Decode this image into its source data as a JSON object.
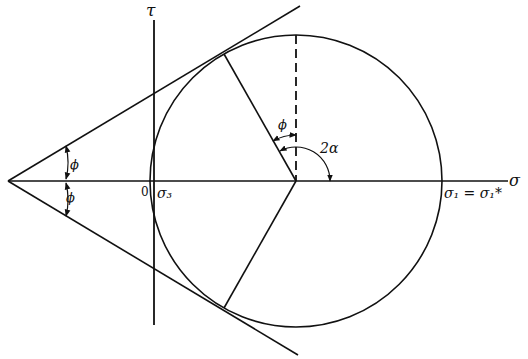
{
  "diagram": {
    "type": "Mohr circle with failure envelope",
    "axes": {
      "tau_label": "τ",
      "sigma_label": "σ",
      "origin_label": "0"
    },
    "labels": {
      "sigma3": "σ₃",
      "sigma1": "σ₁ = σ₁*",
      "phi_upper_apex": "ϕ",
      "phi_lower_apex": "ϕ",
      "phi_center": "ϕ",
      "two_alpha": "2α"
    },
    "colors": {
      "line": "#111111",
      "background": "#ffffff"
    }
  }
}
